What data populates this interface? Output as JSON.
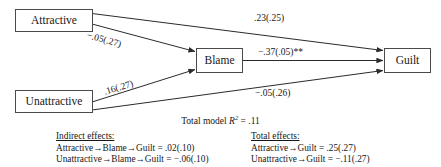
{
  "diagram": {
    "type": "path-mediation-diagram",
    "nodes": [
      {
        "id": "attractive",
        "label": "Attractive"
      },
      {
        "id": "unattractive",
        "label": "Unattractive"
      },
      {
        "id": "blame",
        "label": "Blame"
      },
      {
        "id": "guilt",
        "label": "Guilt"
      }
    ],
    "edges": [
      {
        "id": "attractive-guilt",
        "from": "Attractive",
        "to": "Guilt",
        "label": ".23(.25)"
      },
      {
        "id": "attractive-blame",
        "from": "Attractive",
        "to": "Blame",
        "label": "−.05(.27)"
      },
      {
        "id": "unattractive-blame",
        "from": "Unattractive",
        "to": "Blame",
        "label": ".16(.27)"
      },
      {
        "id": "unattractive-guilt",
        "from": "Unattractive",
        "to": "Guilt",
        "label": "−.05(.26)"
      },
      {
        "id": "blame-guilt",
        "from": "Blame",
        "to": "Guilt",
        "label": "−.37(.05)**"
      }
    ],
    "model_fit": {
      "prefix": "Total model ",
      "symbol": "R",
      "exponent": "2",
      "value": " = .11"
    },
    "indirect_effects": {
      "heading": "Indirect effects:",
      "lines": [
        "Attractive→Blame→Guilt = .02(.10)",
        "Unattractive→Blame→Guilt = −.06(.10)"
      ]
    },
    "total_effects": {
      "heading": "Total effects:",
      "lines": [
        "Attractive→Guilt = .25(.27)",
        "Unattractive→Guilt = −.11(.27)"
      ]
    },
    "colors": {
      "line": "#2b2b2b",
      "box_border": "#4a4a4a",
      "text": "#171717",
      "background": "#ffffff"
    }
  }
}
